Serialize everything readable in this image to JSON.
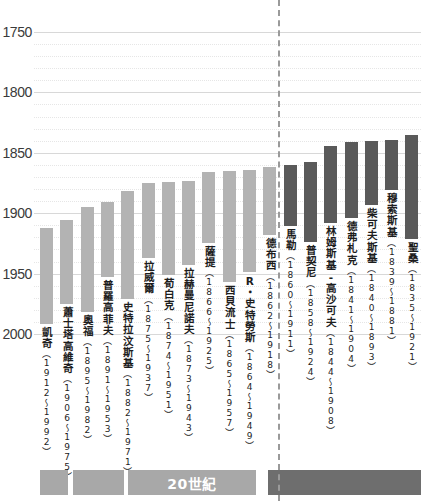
{
  "chart_data": {
    "type": "bar",
    "title": "",
    "subtitle": "",
    "xlabel": "",
    "ylabel": "",
    "orientation": "vertical-inverted-year-axis",
    "grid": true,
    "legend_position": "none",
    "yaxis": {
      "label_values": [
        1750,
        1800,
        1850,
        1900,
        1950,
        2000
      ],
      "tick_labels": [
        "1750",
        "1800",
        "1850",
        "1900",
        "1950",
        "2000"
      ],
      "ylim": [
        1750,
        2000
      ],
      "inverted": true,
      "minor_step": 10,
      "major_step": 50
    },
    "colors": {
      "bar_light": "#b3b3b3",
      "bar_dark": "#5a5a5a",
      "gridline_major": "#d8d8d8",
      "gridline_minor": "#e6e6e6",
      "divider": "#9a9a9a",
      "era_light": "#a8a8a8",
      "era_dark": "#6e6e6e",
      "text": "#1d1d1d"
    },
    "categories": [
      "凱奇",
      "蕭士塔高維奇",
      "奧福",
      "普羅高菲夫",
      "史特拉汶斯基",
      "拉威爾",
      "荀白克",
      "拉赫曼尼諾夫",
      "薩提",
      "西貝流士",
      "R・史特勞斯",
      "德布西",
      "馬勒",
      "普契尼",
      "林姆斯基-高沙可夫",
      "德弗札克",
      "柴可夫斯基",
      "穆索斯基",
      "聖桑"
    ],
    "bars": [
      {
        "name": "凱奇",
        "years": "（1912～1992）",
        "birth": 1912,
        "death": 1992,
        "group": "light"
      },
      {
        "name": "蕭士塔高維奇",
        "years": "（1906～1975）",
        "birth": 1906,
        "death": 1975,
        "group": "light"
      },
      {
        "name": "奧福",
        "years": "（1895～1982）",
        "birth": 1895,
        "death": 1982,
        "group": "light"
      },
      {
        "name": "普羅高菲夫",
        "years": "（1891～1953）",
        "birth": 1891,
        "death": 1953,
        "group": "light"
      },
      {
        "name": "史特拉汶斯基",
        "years": "（1882～1971）",
        "birth": 1882,
        "death": 1971,
        "group": "light"
      },
      {
        "name": "拉威爾",
        "years": "（1875～1937）",
        "birth": 1875,
        "death": 1937,
        "group": "light"
      },
      {
        "name": "荀白克",
        "years": "（1874～1951）",
        "birth": 1874,
        "death": 1951,
        "group": "light"
      },
      {
        "name": "拉赫曼尼諾夫",
        "years": "（1873～1943）",
        "birth": 1873,
        "death": 1943,
        "group": "light"
      },
      {
        "name": "薩提",
        "years": "（1866～1925）",
        "birth": 1866,
        "death": 1925,
        "group": "light"
      },
      {
        "name": "西貝流士",
        "years": "（1865～1957）",
        "birth": 1865,
        "death": 1957,
        "group": "light"
      },
      {
        "name": "R・史特勞斯",
        "years": "（1864～1949）",
        "birth": 1864,
        "death": 1949,
        "group": "light"
      },
      {
        "name": "德布西",
        "years": "（1862～1918）",
        "birth": 1862,
        "death": 1918,
        "group": "light"
      },
      {
        "name": "馬勒",
        "years": "（1860～1911）",
        "birth": 1860,
        "death": 1911,
        "group": "dark"
      },
      {
        "name": "普契尼",
        "years": "（1858～1924）",
        "birth": 1858,
        "death": 1924,
        "group": "dark"
      },
      {
        "name": "林姆斯基-高沙可夫",
        "years": "（1844～1908）",
        "birth": 1844,
        "death": 1908,
        "group": "dark"
      },
      {
        "name": "德弗札克",
        "years": "（1841～1904）",
        "birth": 1841,
        "death": 1904,
        "group": "dark"
      },
      {
        "name": "柴可夫斯基",
        "years": "（1840～1893）",
        "birth": 1840,
        "death": 1893,
        "group": "dark"
      },
      {
        "name": "穆索斯基",
        "years": "（1839～1881）",
        "birth": 1839,
        "death": 1881,
        "group": "dark"
      },
      {
        "name": "聖桑",
        "years": "（1835～1921）",
        "birth": 1835,
        "death": 1921,
        "group": "dark"
      }
    ],
    "era_strip": {
      "segments": [
        {
          "label": "",
          "group": "light"
        },
        {
          "label": "",
          "group": "light"
        },
        {
          "label": "20世紀",
          "group": "light"
        },
        {
          "label": "",
          "group": "dark"
        }
      ]
    }
  }
}
